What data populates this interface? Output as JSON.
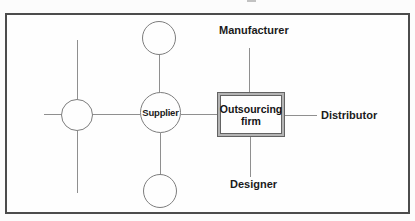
{
  "figure": {
    "type": "network-diagram",
    "labels": {
      "manufacturer": "Manufacturer",
      "distributor": "Distributor",
      "designer": "Designer",
      "supplier": "Supplier",
      "outsourcing_line1": "Outsourcing",
      "outsourcing_line2": "firm"
    },
    "nodes": [
      {
        "id": "supplier",
        "label": "Supplier",
        "shape": "circle"
      },
      {
        "id": "outsourcing-firm",
        "label": "Outsourcing firm",
        "shape": "double-border-rectangle"
      },
      {
        "id": "manufacturer",
        "label": "Manufacturer",
        "shape": "text-only"
      },
      {
        "id": "distributor",
        "label": "Distributor",
        "shape": "text-only"
      },
      {
        "id": "designer",
        "label": "Designer",
        "shape": "text-only"
      },
      {
        "id": "circle-top",
        "label": "",
        "shape": "circle"
      },
      {
        "id": "circle-left",
        "label": "",
        "shape": "circle"
      },
      {
        "id": "circle-bottom",
        "label": "",
        "shape": "circle"
      }
    ],
    "edges": [
      {
        "from": "supplier",
        "to": "outsourcing-firm"
      },
      {
        "from": "outsourcing-firm",
        "to": "manufacturer"
      },
      {
        "from": "outsourcing-firm",
        "to": "distributor"
      },
      {
        "from": "outsourcing-firm",
        "to": "designer"
      },
      {
        "from": "supplier",
        "to": "circle-top"
      },
      {
        "from": "supplier",
        "to": "circle-bottom"
      },
      {
        "from": "supplier",
        "to": "circle-left"
      },
      {
        "from": "circle-left",
        "to": "dangling-up"
      },
      {
        "from": "circle-left",
        "to": "dangling-down"
      },
      {
        "from": "circle-left",
        "to": "dangling-left"
      }
    ],
    "colors": {
      "frame": "#4c4c4c",
      "line": "#8f8f8f",
      "node_stroke": "#7d7d7d",
      "text": "#1b1b1b",
      "box_border": "#636363",
      "box_band": "#b4b4b4",
      "background": "#fcfcfc"
    }
  }
}
